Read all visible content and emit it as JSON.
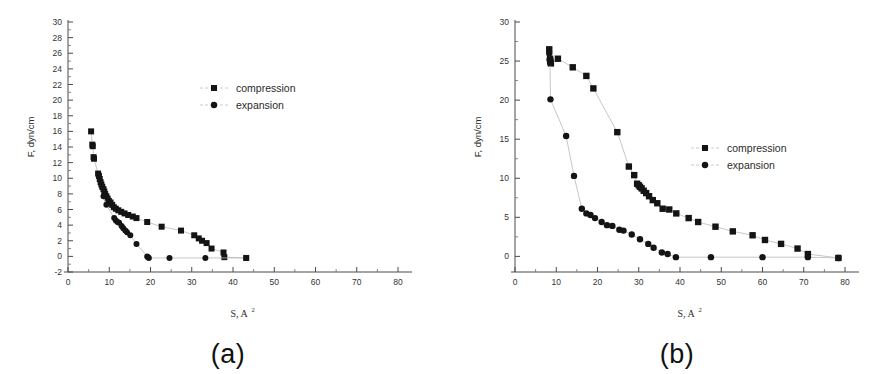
{
  "figure": {
    "background_color": "#ffffff",
    "marker_color": "#141414",
    "line_color": "#b9b9b9",
    "axis_color": "#4a4a4a"
  },
  "panels": [
    {
      "id": "a",
      "caption": "(a)",
      "xlabel_main": "S, A",
      "xlabel_sup": "2",
      "ylabel": "F, dyn/cm",
      "legend": [
        {
          "label": "compression",
          "marker": "square"
        },
        {
          "label": "expansion",
          "marker": "circle"
        }
      ],
      "xticks": [
        0,
        10,
        20,
        30,
        40,
        50,
        60,
        70,
        80
      ],
      "yticks": [
        -2,
        0,
        2,
        4,
        6,
        8,
        10,
        12,
        14,
        16,
        18,
        20,
        22,
        24,
        26,
        28,
        30
      ]
    },
    {
      "id": "b",
      "caption": "(b)",
      "xlabel_main": "S, A",
      "xlabel_sup": "2",
      "ylabel": "F, dyn/cm",
      "legend": [
        {
          "label": "compression",
          "marker": "square"
        },
        {
          "label": "expansion",
          "marker": "circle"
        }
      ],
      "xticks": [
        0,
        10,
        20,
        30,
        40,
        50,
        60,
        70,
        80
      ],
      "yticks": [
        0,
        5,
        10,
        15,
        20,
        25,
        30
      ]
    }
  ],
  "chart_data": [
    {
      "type": "scatter",
      "panel": "a",
      "title": "",
      "xlabel": "S, A2",
      "ylabel": "F, dyn/cm",
      "xlim": [
        0,
        80
      ],
      "ylim": [
        -2,
        30
      ],
      "xticks": [
        0,
        10,
        20,
        30,
        40,
        50,
        60,
        70,
        80
      ],
      "yticks": [
        -2,
        0,
        2,
        4,
        6,
        8,
        10,
        12,
        14,
        16,
        18,
        20,
        22,
        24,
        26,
        28,
        30
      ],
      "grid": false,
      "legend_position": "upper-right",
      "series": [
        {
          "name": "compression",
          "marker": "square",
          "points": [
            [
              5.6,
              16.0
            ],
            [
              5.9,
              14.3
            ],
            [
              6.0,
              14.1
            ],
            [
              6.2,
              12.7
            ],
            [
              6.3,
              12.5
            ],
            [
              7.3,
              10.6
            ],
            [
              7.5,
              10.3
            ],
            [
              7.7,
              9.9
            ],
            [
              7.9,
              9.5
            ],
            [
              8.1,
              9.2
            ],
            [
              8.3,
              8.9
            ],
            [
              8.6,
              8.6
            ],
            [
              8.8,
              8.3
            ],
            [
              9.0,
              8.0
            ],
            [
              9.3,
              7.7
            ],
            [
              9.6,
              7.4
            ],
            [
              9.9,
              7.1
            ],
            [
              10.3,
              6.9
            ],
            [
              10.7,
              6.6
            ],
            [
              11.1,
              6.3
            ],
            [
              11.6,
              6.1
            ],
            [
              12.2,
              5.9
            ],
            [
              12.9,
              5.7
            ],
            [
              13.7,
              5.5
            ],
            [
              14.6,
              5.3
            ],
            [
              15.7,
              5.1
            ],
            [
              16.6,
              4.9
            ],
            [
              19.2,
              4.4
            ],
            [
              22.7,
              3.8
            ],
            [
              27.4,
              3.3
            ],
            [
              30.6,
              2.7
            ],
            [
              31.7,
              2.3
            ],
            [
              32.5,
              2.0
            ],
            [
              33.6,
              1.7
            ],
            [
              34.8,
              1.0
            ],
            [
              37.7,
              0.5
            ],
            [
              37.9,
              -0.1
            ],
            [
              43.2,
              -0.2
            ]
          ]
        },
        {
          "name": "expansion",
          "marker": "circle",
          "points": [
            [
              8.6,
              7.7
            ],
            [
              9.3,
              6.6
            ],
            [
              11.2,
              4.9
            ],
            [
              11.6,
              4.6
            ],
            [
              12.0,
              4.4
            ],
            [
              12.4,
              4.3
            ],
            [
              13.0,
              3.9
            ],
            [
              13.4,
              3.6
            ],
            [
              13.9,
              3.3
            ],
            [
              14.3,
              3.1
            ],
            [
              15.1,
              2.7
            ],
            [
              16.6,
              1.6
            ],
            [
              19.2,
              0.0
            ],
            [
              19.4,
              -0.1
            ],
            [
              19.6,
              -0.2
            ],
            [
              24.6,
              -0.2
            ],
            [
              33.3,
              -0.2
            ],
            [
              43.2,
              -0.2
            ]
          ]
        }
      ]
    },
    {
      "type": "scatter",
      "panel": "b",
      "title": "",
      "xlabel": "S, A2",
      "ylabel": "F, dyn/cm",
      "xlim": [
        0,
        80
      ],
      "ylim": [
        -2,
        30
      ],
      "xticks": [
        0,
        10,
        20,
        30,
        40,
        50,
        60,
        70,
        80
      ],
      "yticks": [
        0,
        5,
        10,
        15,
        20,
        25,
        30
      ],
      "grid": false,
      "legend_position": "right",
      "series": [
        {
          "name": "compression",
          "marker": "square",
          "points": [
            [
              8.3,
              26.5
            ],
            [
              8.5,
              25.3
            ],
            [
              8.6,
              25.0
            ],
            [
              8.7,
              24.7
            ],
            [
              10.4,
              25.3
            ],
            [
              14.0,
              24.2
            ],
            [
              17.3,
              23.1
            ],
            [
              19.0,
              21.5
            ],
            [
              24.8,
              15.9
            ],
            [
              27.6,
              11.5
            ],
            [
              28.9,
              10.4
            ],
            [
              29.6,
              9.3
            ],
            [
              30.0,
              9.1
            ],
            [
              30.3,
              8.9
            ],
            [
              30.7,
              8.7
            ],
            [
              31.2,
              8.4
            ],
            [
              31.8,
              8.1
            ],
            [
              32.5,
              7.7
            ],
            [
              33.4,
              7.2
            ],
            [
              34.5,
              6.8
            ],
            [
              35.8,
              6.1
            ],
            [
              37.4,
              6.0
            ],
            [
              39.1,
              5.5
            ],
            [
              42.1,
              4.9
            ],
            [
              44.4,
              4.4
            ],
            [
              48.6,
              3.8
            ],
            [
              52.8,
              3.2
            ],
            [
              57.6,
              2.7
            ],
            [
              60.6,
              2.1
            ],
            [
              64.5,
              1.6
            ],
            [
              68.5,
              1.0
            ],
            [
              71.0,
              0.3
            ],
            [
              78.4,
              -0.2
            ]
          ]
        },
        {
          "name": "expansion",
          "marker": "circle",
          "points": [
            [
              8.3,
              26.0
            ],
            [
              8.4,
              25.2
            ],
            [
              8.5,
              24.8
            ],
            [
              8.6,
              20.1
            ],
            [
              12.4,
              15.4
            ],
            [
              14.3,
              10.3
            ],
            [
              16.2,
              6.1
            ],
            [
              17.3,
              5.5
            ],
            [
              18.3,
              5.3
            ],
            [
              19.4,
              4.9
            ],
            [
              21.0,
              4.4
            ],
            [
              22.3,
              4.0
            ],
            [
              23.6,
              3.9
            ],
            [
              25.3,
              3.4
            ],
            [
              26.3,
              3.3
            ],
            [
              28.3,
              2.8
            ],
            [
              30.3,
              2.2
            ],
            [
              32.3,
              1.6
            ],
            [
              33.6,
              1.1
            ],
            [
              35.6,
              0.5
            ],
            [
              37.0,
              0.3
            ],
            [
              39.0,
              -0.1
            ],
            [
              47.5,
              -0.1
            ],
            [
              60.0,
              -0.1
            ],
            [
              71.0,
              -0.1
            ],
            [
              78.4,
              -0.2
            ]
          ]
        }
      ]
    }
  ]
}
